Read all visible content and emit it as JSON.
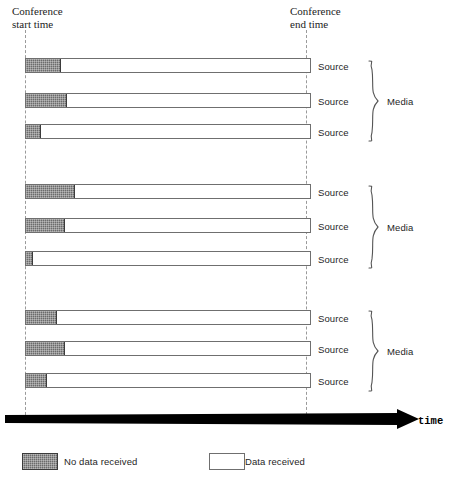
{
  "figure": {
    "axis": {
      "start_label": "Conference\nstart time",
      "end_label": "Conference\nend time",
      "time_label": "time",
      "start_x": 25,
      "end_x": 306
    },
    "geometry": {
      "bar_left": 25,
      "bar_right": 311,
      "bar_height": 15
    },
    "groups": [
      {
        "name": "Media",
        "brace_top": 60,
        "brace_height": 82,
        "media_label_y": 96,
        "rows": [
          {
            "label": "Source",
            "y": 58,
            "no_data_width": 34
          },
          {
            "label": "Source",
            "y": 93,
            "no_data_width": 40
          },
          {
            "label": "Source",
            "y": 124,
            "no_data_width": 14
          }
        ]
      },
      {
        "name": "Media",
        "brace_top": 185,
        "brace_height": 84,
        "media_label_y": 222,
        "rows": [
          {
            "label": "Source",
            "y": 184,
            "no_data_width": 48
          },
          {
            "label": "Source",
            "y": 218,
            "no_data_width": 38
          },
          {
            "label": "Source",
            "y": 251,
            "no_data_width": 6
          }
        ]
      },
      {
        "name": "Media",
        "brace_top": 310,
        "brace_height": 82,
        "media_label_y": 346,
        "rows": [
          {
            "label": "Source",
            "y": 310,
            "no_data_width": 30
          },
          {
            "label": "Source",
            "y": 341,
            "no_data_width": 38
          },
          {
            "label": "Source",
            "y": 373,
            "no_data_width": 20
          }
        ]
      }
    ],
    "legend": [
      {
        "swatch": "no-data",
        "label": "No data received"
      },
      {
        "swatch": "data",
        "label": "Data received"
      }
    ],
    "colors": {
      "no_data_fill": "#6b6b6b",
      "data_fill": "#ffffff",
      "bar_stroke": "#6f6f6f",
      "guide_line": "#9a9a9a",
      "axis_arrow": "#000000",
      "text": "#262626"
    }
  }
}
